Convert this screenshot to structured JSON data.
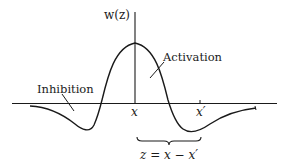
{
  "diagram": {
    "type": "mexican-hat-function",
    "axis_labels": {
      "y": "w(z)",
      "x_origin": "x",
      "x_prime": "x′"
    },
    "annotations": {
      "activation": "Activation",
      "inhibition": "Inhibition",
      "brace_label": "z = x − x′"
    },
    "colors": {
      "ink": "#1a1a1a",
      "background": "#ffffff"
    }
  }
}
